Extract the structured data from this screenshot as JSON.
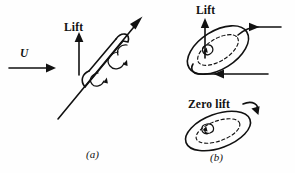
{
  "figure": {
    "background_color": "#fefefe",
    "ink_color": "#111111",
    "width": 295,
    "height": 173,
    "panels": [
      {
        "id": "a",
        "caption": "(a)",
        "description": "Inclined spinning cylinder in a freestream; side view",
        "labels": [
          {
            "name": "lift",
            "text": "Lift"
          },
          {
            "name": "freestream",
            "text": "U"
          }
        ]
      },
      {
        "id": "b",
        "caption": "(b)",
        "description": "End views of the rotating cylinder showing lift and zero-lift cases",
        "labels": [
          {
            "name": "lift",
            "text": "Lift"
          },
          {
            "name": "zero-lift",
            "text": "Zero lift"
          }
        ]
      }
    ]
  },
  "labels": {
    "lift_a": "Lift",
    "lift_b": "Lift",
    "zero_lift": "Zero lift",
    "freestream_velocity": "U",
    "panel_a": "(a)",
    "panel_b": "(b)"
  },
  "annotations": {
    "lift_arrow_direction": "up",
    "freestream_arrow_direction": "right",
    "spin_axis_direction": "up-right",
    "circulation_direction": "counterclockwise",
    "upper_flow_direction": "right",
    "lower_flow_direction": "left"
  }
}
